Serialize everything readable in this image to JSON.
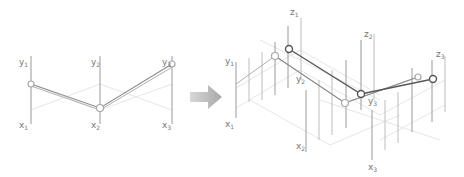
{
  "left_panel": {
    "title": "2D parallel coordinates",
    "axes": [
      {
        "label": "y",
        "sub": "1",
        "bottom_label": "x",
        "bottom_sub": "1"
      },
      {
        "label": "y",
        "sub": "2",
        "bottom_label": "x",
        "bottom_sub": "2"
      },
      {
        "label": "y",
        "sub": "3",
        "bottom_label": "x",
        "bottom_sub": "3"
      }
    ]
  },
  "arrow": {
    "direction": "right",
    "color": "#bfbfbf"
  },
  "right_panel": {
    "title": "3D parallel coordinates",
    "axes": [
      {
        "y_label": "y",
        "y_sub": "1",
        "x_label": "x",
        "x_sub": "1",
        "z_label": "z",
        "z_sub": "1"
      },
      {
        "y_label": "y",
        "y_sub": "2",
        "x_label": "x",
        "x_sub": "2",
        "z_label": "z",
        "z_sub": "2"
      },
      {
        "y_label": "y",
        "y_sub": "3",
        "x_label": "x",
        "x_sub": "3",
        "z_label": "z",
        "z_sub": "3"
      }
    ]
  },
  "colors": {
    "axis": "#9a9a9a",
    "grid": "#e6e6e6",
    "polyline_dark": "#555555",
    "polyline_light": "#b0b0b0"
  }
}
